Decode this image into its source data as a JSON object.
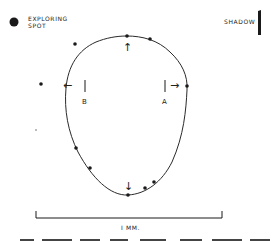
{
  "legend": {
    "exploring_spot_label_line1": "EXPLORING",
    "exploring_spot_label_line2": "SPOT",
    "shadow_label": "SHADOW"
  },
  "markers": {
    "a_label": "A",
    "b_label": "B"
  },
  "arrows": {
    "up": "↑",
    "down": "↓",
    "left": "←",
    "right": "→"
  },
  "scale": {
    "label": "I MM."
  },
  "colors": {
    "ink": "#1a1a1a",
    "background": "#ffffff"
  },
  "exploring_spots": [
    {
      "x": 127,
      "y": 36
    },
    {
      "x": 150,
      "y": 39
    },
    {
      "x": 75,
      "y": 44
    },
    {
      "x": 41,
      "y": 84
    },
    {
      "x": 187,
      "y": 86
    },
    {
      "x": 76,
      "y": 148
    },
    {
      "x": 90,
      "y": 168
    },
    {
      "x": 128,
      "y": 195
    },
    {
      "x": 145,
      "y": 188
    },
    {
      "x": 154,
      "y": 182
    }
  ]
}
